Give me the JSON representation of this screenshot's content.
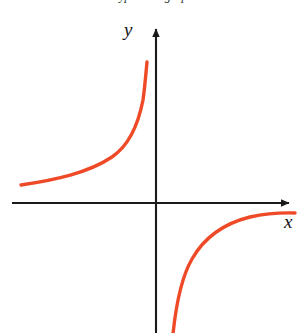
{
  "figure": {
    "title_fragment": "Hyperbola graph",
    "background_color": "#ffffff",
    "width": 304,
    "height": 333
  },
  "axes": {
    "x_label": "x",
    "y_label": "y",
    "axis_color": "#1a1a1a",
    "x_axis_y_px": 203,
    "y_axis_x_px": 156,
    "x_axis_start_px": 12,
    "x_axis_end_px": 296,
    "y_axis_top_px": 22,
    "y_axis_bottom_px": 333,
    "arrowheads": [
      "x-positive",
      "y-positive"
    ],
    "tick_labels": [],
    "gridlines": false
  },
  "chart_data": {
    "type": "line",
    "title": "",
    "subtitle": "",
    "xlabel": "x",
    "ylabel": "y",
    "curve_color": "#ef4a28",
    "curve_width_px": 3.4,
    "xlim": [
      -4.8,
      4.8
    ],
    "ylim": [
      -4.4,
      4.0
    ],
    "grid": false,
    "legend": null,
    "origin_px": [
      156,
      203
    ],
    "px_per_unit_x": 29,
    "px_per_unit_y": 29,
    "series": [
      {
        "name": "branch-upper-left",
        "equation": "y = -1/x  (x < 0)",
        "quadrant": "II",
        "x": [
          -4.65,
          -4.0,
          -3.4,
          -2.8,
          -2.3,
          -1.9,
          -1.55,
          -1.25,
          -1.0,
          -0.8,
          -0.62,
          -0.48,
          -0.38,
          -0.31
        ],
        "y": [
          0.62,
          0.7,
          0.79,
          0.9,
          1.02,
          1.18,
          1.38,
          1.62,
          1.95,
          2.35,
          2.85,
          3.45,
          4.05,
          4.55
        ],
        "start_px": [
          21,
          185
        ],
        "end_px": [
          147,
          62
        ]
      },
      {
        "name": "branch-lower-right",
        "equation": "y = -1/x  (x > 0)",
        "quadrant": "IV",
        "x": [
          0.55,
          0.68,
          0.85,
          1.05,
          1.3,
          1.6,
          1.95,
          2.35,
          2.8,
          3.3,
          3.85,
          4.4,
          4.8
        ],
        "y": [
          -4.5,
          -3.8,
          -3.1,
          -2.5,
          -2.05,
          -1.68,
          -1.38,
          -1.15,
          -0.97,
          -0.83,
          -0.71,
          -0.62,
          -0.55
        ],
        "start_px": [
          172,
          333
        ],
        "end_px": [
          295,
          213
        ]
      }
    ],
    "annotations": []
  }
}
